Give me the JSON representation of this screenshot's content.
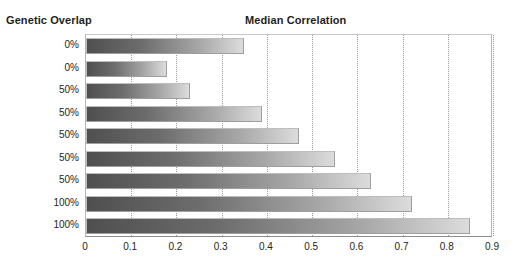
{
  "header": {
    "group_axis_title": "Genetic Overlap",
    "chart_title": "Median Correlation"
  },
  "chart_data": {
    "type": "bar",
    "orientation": "horizontal",
    "title": "Median Correlation",
    "xlabel": "",
    "ylabel": "Genetic Overlap",
    "xlim": [
      0,
      0.9
    ],
    "xticks": [
      0,
      0.1,
      0.2,
      0.3,
      0.4,
      0.5,
      0.6,
      0.7,
      0.8,
      0.9
    ],
    "xtick_labels": [
      "0",
      "0.1",
      "0.2",
      "0.3",
      "0.4",
      "0.5",
      "0.6",
      "0.7",
      "0.8",
      "0.9"
    ],
    "grid": "vertical-dotted",
    "legend": "none",
    "categories": [
      "0%",
      "0%",
      "50%",
      "50%",
      "50%",
      "50%",
      "50%",
      "100%",
      "100%"
    ],
    "values": [
      0.35,
      0.18,
      0.23,
      0.39,
      0.47,
      0.55,
      0.63,
      0.72,
      0.85
    ],
    "bar_style": {
      "gradient_from": "#4f4f4f",
      "gradient_to": "#dcdcdc",
      "border": "#bdbdbd"
    }
  },
  "colors": {
    "text": "#231f20",
    "gridline": "#9a9a9a",
    "axis": "#8d8d8d",
    "background": "#ffffff"
  }
}
